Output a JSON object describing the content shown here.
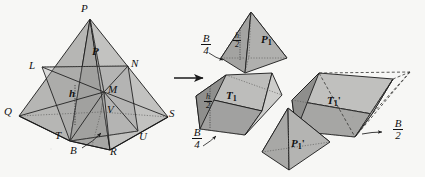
{
  "figure": {
    "background_color": "#f7f7f5",
    "line_color": "#1a1a1a",
    "transform_arrow": "right-arrow"
  },
  "colors": {
    "fill_light": "#d4d4d2",
    "fill_mid": "#b9b9b7",
    "fill_dark": "#9d9d9b",
    "fill_darker": "#8b8b89",
    "fill_pale": "#e2e2e0",
    "stroke": "#1a1a1a",
    "dotted": "#555553"
  },
  "main_pyramid": {
    "name": "labeled-pyramid",
    "face_label": "P",
    "height_label": "h",
    "base_label": "B",
    "vertices": [
      {
        "id": "P",
        "label": "P",
        "x": 84,
        "y": 11
      },
      {
        "id": "L",
        "label": "L",
        "x": 33,
        "y": 68
      },
      {
        "id": "N",
        "label": "N",
        "x": 133,
        "y": 66
      },
      {
        "id": "M",
        "label": "M",
        "x": 109,
        "y": 91
      },
      {
        "id": "V",
        "label": "V",
        "x": 110,
        "y": 112
      },
      {
        "id": "Q",
        "label": "Q",
        "x": 8,
        "y": 113
      },
      {
        "id": "S",
        "label": "S",
        "x": 171,
        "y": 115
      },
      {
        "id": "T",
        "label": "T",
        "x": 58,
        "y": 137
      },
      {
        "id": "U",
        "label": "U",
        "x": 141,
        "y": 138
      },
      {
        "id": "R",
        "label": "R",
        "x": 113,
        "y": 153
      },
      {
        "id": "B",
        "label": "B",
        "x": 74,
        "y": 152
      }
    ]
  },
  "pieces": [
    {
      "id": "P1",
      "name": "small-pyramid-P1",
      "label_main": "P",
      "label_sub": "1",
      "label_prime": "",
      "height_fraction": {
        "num": "h",
        "den": "2"
      },
      "base_fraction": {
        "num": "B",
        "den": "4"
      }
    },
    {
      "id": "T1",
      "name": "prism-T1",
      "label_main": "T",
      "label_sub": "1",
      "label_prime": "",
      "height_fraction": {
        "num": "h",
        "den": "2"
      },
      "base_fraction": {
        "num": "B",
        "den": "4"
      }
    },
    {
      "id": "T1p",
      "name": "prism-T1-prime",
      "label_main": "T",
      "label_sub": "1",
      "label_prime": "'",
      "height_fraction": null,
      "base_fraction": {
        "num": "B",
        "den": "2"
      }
    },
    {
      "id": "P1p",
      "name": "small-pyramid-P1-prime",
      "label_main": "P",
      "label_sub": "1",
      "label_prime": "'",
      "height_fraction": null,
      "base_fraction": null
    }
  ],
  "annotations": {
    "arrow_label": "",
    "B_curved_arrow": "curved-arrow-to-base",
    "B4_upper_arrow": "curved-arrow-to-P1-base",
    "B4_lower_arrow": "curved-arrow-to-T1-base",
    "B2_arrow": "curved-arrow-to-T1prime-base"
  }
}
